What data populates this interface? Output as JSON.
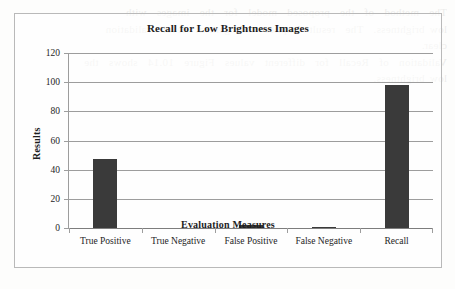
{
  "chart_data": {
    "type": "bar",
    "title": "Recall for Low Brightness Images",
    "xlabel": "Evaluation Measures",
    "ylabel": "Results",
    "categories": [
      "True Positive",
      "True Negative",
      "False Positive",
      "False Negative",
      "Recall"
    ],
    "values": [
      47,
      0,
      2,
      1,
      98
    ],
    "series": [
      {
        "name": "Results",
        "values": [
          47,
          0,
          2,
          1,
          98
        ]
      }
    ],
    "ylim": [
      0,
      120
    ],
    "ytick_labels": [
      "0",
      "20",
      "40",
      "60",
      "80",
      "100",
      "120"
    ],
    "ytick_values": [
      0,
      20,
      40,
      60,
      80,
      100,
      120
    ],
    "grid": "horizontal",
    "legend": "none",
    "bar_color": "#3a3a3a",
    "gridline_color": "#9d9d9d",
    "border_color": "#b9b9b9",
    "text_color": "#1d1d1d"
  },
  "background_text": "The  method  of  the  proposed  model  for  the  images  with\nlow brightness.  The  result  implies  the  general  level  validation\nclear.\nValidation  of  Recall  for  different  values  Figure  10.14  shows  the\nlow brightness."
}
